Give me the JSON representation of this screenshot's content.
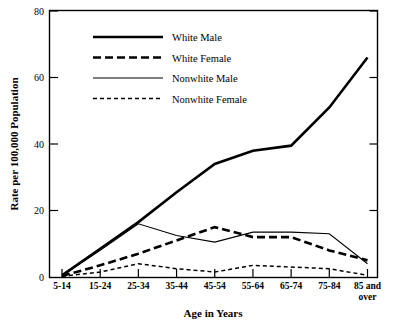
{
  "chart_data": {
    "type": "line",
    "title": "",
    "xlabel": "Age in Years",
    "ylabel": "Rate per 100,000 Population",
    "categories": [
      "5-14",
      "15-24",
      "25-34",
      "35-44",
      "45-54",
      "55-64",
      "65-74",
      "75-84",
      "85 and over"
    ],
    "x_tick_labels": [
      "5-14",
      "15-24",
      "25-34",
      "35-44",
      "45-54",
      "55-64",
      "65-74",
      "75-84",
      "85 and\nover"
    ],
    "y_tick_labels": [
      "0",
      "20",
      "40",
      "60",
      "80"
    ],
    "y_tick_values": [
      0,
      20,
      40,
      60,
      80
    ],
    "ylim": [
      0,
      80
    ],
    "grid": false,
    "legend_position": "upper-center-left",
    "series": [
      {
        "name": "White Male",
        "style": "solid-thick",
        "values": [
          0.5,
          8.5,
          16.5,
          25.5,
          34.0,
          38.0,
          39.5,
          51.0,
          66.0
        ]
      },
      {
        "name": "White Female",
        "style": "dashed-thick",
        "values": [
          0.3,
          3.5,
          7.0,
          11.0,
          15.0,
          12.0,
          12.0,
          8.0,
          5.0
        ]
      },
      {
        "name": "Nonwhite Male",
        "style": "solid-thin",
        "values": [
          0.4,
          8.0,
          16.0,
          12.5,
          10.5,
          13.5,
          13.5,
          13.0,
          4.0
        ]
      },
      {
        "name": "Nonwhite Female",
        "style": "dashed-thin",
        "values": [
          0.2,
          1.5,
          4.0,
          2.5,
          1.5,
          3.5,
          3.0,
          2.5,
          0.5
        ]
      }
    ]
  },
  "legend": {
    "entries": [
      {
        "label": "White Male"
      },
      {
        "label": "White Female"
      },
      {
        "label": "Nonwhite Male"
      },
      {
        "label": "Nonwhite Female"
      }
    ]
  },
  "axes": {
    "y_title": "Rate per 100,000 Population",
    "x_title": "Age in Years"
  },
  "colors": {
    "line": "#000000",
    "background": "#ffffff",
    "text": "#000000"
  }
}
